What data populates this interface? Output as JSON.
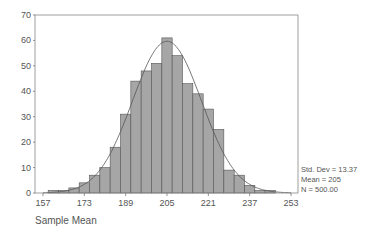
{
  "chart_data": {
    "type": "bar",
    "subtype": "histogram_with_normal_curve",
    "title": "",
    "xlabel": "Sample Mean",
    "ylabel": "",
    "bin_width": 4,
    "categories": [
      157,
      161,
      165,
      169,
      173,
      177,
      181,
      185,
      189,
      193,
      197,
      201,
      205,
      209,
      213,
      217,
      221,
      225,
      229,
      233,
      237,
      241,
      245,
      249,
      253
    ],
    "values": [
      0,
      1,
      1,
      2,
      4,
      7,
      10,
      18,
      31,
      44,
      48,
      51,
      61,
      54,
      43,
      39,
      33,
      25,
      9,
      7,
      3,
      1,
      1,
      0,
      0
    ],
    "xlim": [
      157,
      253
    ],
    "ylim": [
      0,
      70
    ],
    "x_ticks": [
      157,
      173,
      189,
      205,
      221,
      237,
      253
    ],
    "y_ticks": [
      0,
      10,
      20,
      30,
      40,
      50,
      60,
      70
    ],
    "grid": false,
    "normal_curve": {
      "mean": 205,
      "std_dev": 13.37,
      "n": 500
    },
    "legend": null,
    "stats": {
      "std_dev": "Std. Dev = 13.37",
      "mean": "Mean = 205",
      "n": "N = 500.00"
    },
    "colors": {
      "bar_fill": "#a6a6a6",
      "bar_stroke": "#555555",
      "curve": "#555555",
      "axis": "#777777"
    }
  }
}
